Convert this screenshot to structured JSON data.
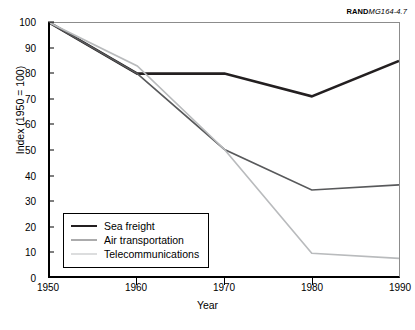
{
  "source_credit": {
    "mark": "RAND",
    "code": "MG164-4.7"
  },
  "chart_data": {
    "type": "line",
    "title": "",
    "xlabel": "Year",
    "ylabel": "Index (1950 = 100)",
    "x": [
      1950,
      1960,
      1970,
      1980,
      1990
    ],
    "xlim": [
      1950,
      1990
    ],
    "ylim": [
      0,
      100
    ],
    "ytick_labels": [
      "0",
      "10",
      "20",
      "30",
      "40",
      "50",
      "60",
      "70",
      "80",
      "90",
      "100"
    ],
    "yticks": [
      0,
      10,
      20,
      30,
      40,
      50,
      60,
      70,
      80,
      90,
      100
    ],
    "xtick_labels": [
      "1950",
      "1960",
      "1970",
      "1980",
      "1990"
    ],
    "xticks": [
      1950,
      1960,
      1970,
      1980,
      1990
    ],
    "grid": false,
    "legend_position": "lower left inside",
    "series": [
      {
        "name": "Sea freight",
        "values": [
          100,
          80,
          80,
          71,
          85
        ],
        "color": "#231f20",
        "width": 2.6
      },
      {
        "name": "Air transportation",
        "values": [
          100,
          80,
          50,
          34,
          36
        ],
        "color": "#58595b",
        "width": 1.7
      },
      {
        "name": "Telecommunications",
        "values": [
          100,
          83,
          50,
          9,
          7
        ],
        "color": "#b9bbbd",
        "width": 1.7
      }
    ]
  }
}
